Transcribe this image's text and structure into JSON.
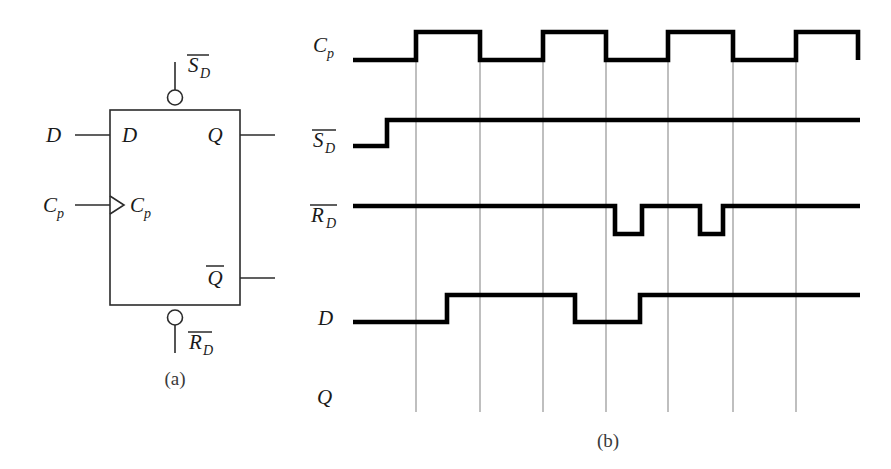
{
  "figure": {
    "captions": {
      "part_a": "(a)",
      "part_b": "(b)"
    },
    "colors": {
      "waveform": "#000000",
      "gridline": "#8a8a8a",
      "symbol_outline": "#2b2b2b",
      "text": "#1a1a1a",
      "background": "#ffffff"
    }
  },
  "symbol": {
    "name": "d-flip-flop-symbol",
    "box": {
      "x": 110,
      "y": 110,
      "width": 130,
      "height": 195
    },
    "pins": [
      {
        "id": "d-input",
        "label": "D",
        "overbar": false,
        "side": "left",
        "external_label": "D",
        "internal_label": "D"
      },
      {
        "id": "clock-input",
        "label": "Cp",
        "overbar": false,
        "side": "left",
        "external_label": "Cp",
        "internal_label": "Cp",
        "edge_triggered": true
      },
      {
        "id": "q-output",
        "label": "Q",
        "overbar": false,
        "side": "right",
        "internal_label": "Q"
      },
      {
        "id": "qbar-output",
        "label": "Q",
        "overbar": true,
        "side": "right",
        "internal_label": "Q"
      },
      {
        "id": "set-input",
        "label": "SD",
        "overbar": true,
        "side": "top",
        "external_label": "SD",
        "active_low": true
      },
      {
        "id": "reset-input",
        "label": "RD",
        "overbar": true,
        "side": "bottom",
        "external_label": "RD",
        "active_low": true
      }
    ],
    "labels": {
      "d_external": "D",
      "cp_external": "Cp",
      "cp_base": "C",
      "cp_sub": "p",
      "d_internal": "D",
      "q_internal": "Q",
      "qbar_internal": "Q",
      "set_base": "S",
      "set_sub": "D",
      "reset_base": "R",
      "reset_sub": "D"
    }
  },
  "timing": {
    "name": "input-timing-diagram",
    "plot_area": {
      "left": 353,
      "right": 860,
      "top": 20,
      "bottom": 412
    },
    "gridlines_x": [
      416,
      480,
      543,
      606,
      668,
      733,
      796
    ],
    "row_labels": [
      {
        "id": "row-cp",
        "base": "C",
        "sub": "p",
        "overbar": false,
        "y": 45
      },
      {
        "id": "row-sd",
        "base": "S",
        "sub": "D",
        "overbar": true,
        "y": 140
      },
      {
        "id": "row-rd",
        "base": "R",
        "sub": "D",
        "overbar": true,
        "y": 215
      },
      {
        "id": "row-d",
        "base": "D",
        "sub": "",
        "overbar": false,
        "y": 318
      },
      {
        "id": "row-q",
        "base": "Q",
        "sub": "",
        "overbar": false,
        "y": 397
      }
    ],
    "waveforms": [
      {
        "id": "waveform-cp",
        "signal": "Cp",
        "high_y": 32,
        "low_y": 60,
        "start_x": 353,
        "end_x": 860,
        "initial_level": "low",
        "transitions_x": [
          416,
          480,
          543,
          606,
          668,
          733,
          796
        ],
        "description": "four clock pulses, starts low, ends high"
      },
      {
        "id": "waveform-sd",
        "signal": "SD",
        "high_y": 120,
        "low_y": 146,
        "start_x": 353,
        "end_x": 860,
        "initial_level": "low",
        "transitions_x": [
          387
        ],
        "description": "low then rises high and stays high"
      },
      {
        "id": "waveform-rd",
        "signal": "RD",
        "high_y": 206,
        "low_y": 234,
        "start_x": 353,
        "end_x": 860,
        "initial_level": "high",
        "transitions_x": [
          615,
          642,
          700,
          723
        ],
        "description": "high with two short active-low reset pulses"
      },
      {
        "id": "waveform-d",
        "signal": "D",
        "high_y": 295,
        "low_y": 322,
        "start_x": 353,
        "end_x": 860,
        "initial_level": "low",
        "transitions_x": [
          447,
          575,
          640
        ],
        "description": "low, high, low glitch, then high to end"
      },
      {
        "id": "waveform-q",
        "signal": "Q",
        "high_y": 375,
        "low_y": 402,
        "start_x": 353,
        "end_x": 860,
        "initial_level": "none",
        "transitions_x": [],
        "description": "blank row, output to be determined"
      }
    ]
  }
}
